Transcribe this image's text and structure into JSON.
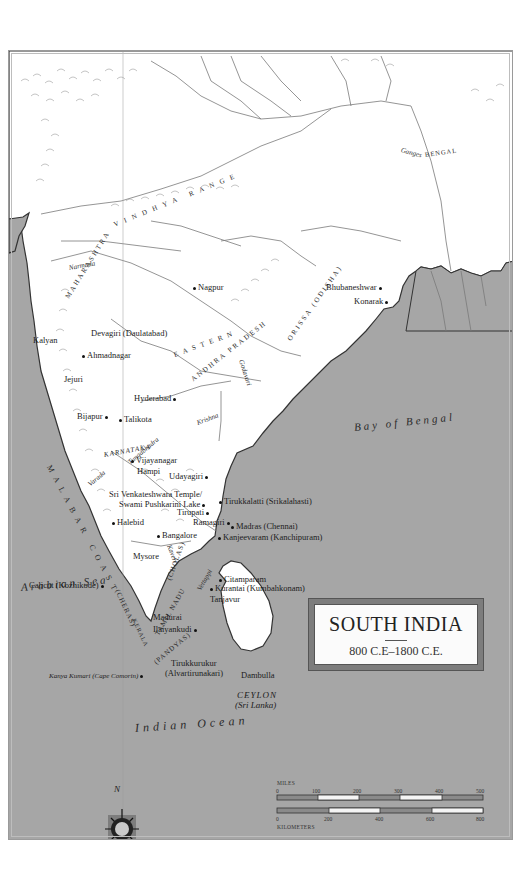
{
  "map": {
    "title": "SOUTH INDIA",
    "dates": "800 C.E–1800 C.E.",
    "colors": {
      "sea": "#a6a6a6",
      "land": "#ffffff",
      "coast": "#3a3a3a",
      "river": "#7a7a7a",
      "frame": "#9a9a9a"
    },
    "water_bodies": {
      "bay_of_bengal": "Bay of Bengal",
      "arabian_sea": "Arabian Sea",
      "indian_ocean": "Indian Ocean"
    },
    "regions": {
      "bengal": "BENGAL",
      "vindhya": "VINDHYA RANGE",
      "maharashtra": "MAHARASHTRA",
      "orissa": "ORISSA (ODISHA)",
      "andhra": "ANDHRA PRADESH",
      "eastern_ghats": "EASTERN",
      "karnataka": "KARNATAKA",
      "malabar": "MALABAR COAST",
      "cheras": "(CHERAS)",
      "kerala": "KERALA",
      "cholas": "(CHOLAS)",
      "tamil_nadu": "TAMIL NADU",
      "pandyas": "(PANDYAS)",
      "ceylon": "CEYLON",
      "sri_lanka": "(Sri Lanka)"
    },
    "rivers": {
      "ganges": "Ganges",
      "narmada": "Narmada",
      "godavari": "Godavari",
      "krishna": "Krishna",
      "tungabhadra": "Tungabhadra",
      "varada": "Varada",
      "kaveri": "Kaveri",
      "vaigai": "Vettappi"
    },
    "places": [
      {
        "name": "Nagpur"
      },
      {
        "name": "Bhubaneshwar"
      },
      {
        "name": "Konarak"
      },
      {
        "name": "Kalyan"
      },
      {
        "name": "Devagiri (Daulatabad)"
      },
      {
        "name": "Ahmadnagar"
      },
      {
        "name": "Jejuri"
      },
      {
        "name": "Hyderabad"
      },
      {
        "name": "Bijapur"
      },
      {
        "name": "Talikota"
      },
      {
        "name": "Vijayanagar"
      },
      {
        "name": "Hampi"
      },
      {
        "name": "Udayagiri"
      },
      {
        "name": "Sri Venkateshwara Temple/"
      },
      {
        "name": "Swami Pushkarini Lake"
      },
      {
        "name": "Tirupati"
      },
      {
        "name": "Tirukkalatti (Srikalahasti)"
      },
      {
        "name": "Ramagiri"
      },
      {
        "name": "Madras (Chennai)"
      },
      {
        "name": "Kanjeevaram (Kanchipuram)"
      },
      {
        "name": "Halebid"
      },
      {
        "name": "Bangalore"
      },
      {
        "name": "Mysore"
      },
      {
        "name": "Calicut (Kozhikode)"
      },
      {
        "name": "Citamparam"
      },
      {
        "name": "Kurantai (Kumbahkonam)"
      },
      {
        "name": "Tanjavur"
      },
      {
        "name": "Madurai"
      },
      {
        "name": "Ilaiyankudi"
      },
      {
        "name": "Tirukkurukur"
      },
      {
        "name": "(Alvartirunakari)"
      },
      {
        "name": "Kanya Kumari (Cape Comorin)"
      },
      {
        "name": "Dambulla"
      }
    ],
    "scale": {
      "miles_label": "MILES",
      "miles_ticks": [
        "0",
        "100",
        "200",
        "300",
        "400",
        "500"
      ],
      "km_label": "KILOMETERS",
      "km_ticks": [
        "0",
        "200",
        "400",
        "600",
        "800"
      ]
    },
    "compass": {
      "north": "N",
      "south": "S",
      "east": "E",
      "west": "W"
    }
  }
}
